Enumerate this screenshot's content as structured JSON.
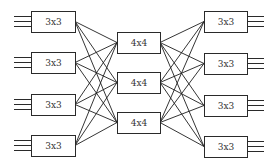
{
  "diagram": {
    "colors": {
      "stroke": "#2a2a2a",
      "background": "#ffffff",
      "text": "#333333"
    },
    "stages": {
      "ingress": {
        "label": "3x3",
        "boxes": [
          {
            "label": "3x3",
            "x": 31,
            "y": 11,
            "w": 44,
            "h": 21
          },
          {
            "label": "3x3",
            "x": 31,
            "y": 52,
            "w": 44,
            "h": 21
          },
          {
            "label": "3x3",
            "x": 31,
            "y": 94,
            "w": 44,
            "h": 21
          },
          {
            "label": "3x3",
            "x": 31,
            "y": 135,
            "w": 44,
            "h": 21
          }
        ],
        "io_lines": 3
      },
      "middle": {
        "label": "4x4",
        "boxes": [
          {
            "label": "4x4",
            "x": 117,
            "y": 32,
            "w": 43,
            "h": 21
          },
          {
            "label": "4x4",
            "x": 117,
            "y": 72,
            "w": 43,
            "h": 21
          },
          {
            "label": "4x4",
            "x": 117,
            "y": 112,
            "w": 43,
            "h": 21
          }
        ]
      },
      "egress": {
        "label": "3x3",
        "boxes": [
          {
            "label": "3x3",
            "x": 204,
            "y": 11,
            "w": 43,
            "h": 21
          },
          {
            "label": "3x3",
            "x": 204,
            "y": 53,
            "w": 43,
            "h": 21
          },
          {
            "label": "3x3",
            "x": 204,
            "y": 95,
            "w": 43,
            "h": 21
          },
          {
            "label": "3x3",
            "x": 204,
            "y": 136,
            "w": 43,
            "h": 21
          }
        ],
        "io_lines": 3
      }
    },
    "io": {
      "left_x1": 14,
      "right_x2": 264,
      "spacing": 5
    }
  }
}
